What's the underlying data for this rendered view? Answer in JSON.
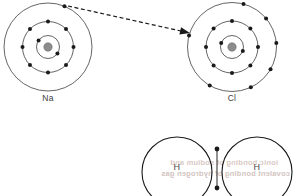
{
  "figure": {
    "width": 295,
    "height": 196,
    "background_color": "#ffffff"
  },
  "colors": {
    "shell_stroke": "#222222",
    "electron_fill": "#1a1a1a",
    "nucleus_fill": "#8c8c8c",
    "nucleus_stroke": "#5a5a5a",
    "arrow_stroke": "#1a1a1a",
    "label_text": "#3c3c3c",
    "h_lobe_stroke": "#1a1a1a",
    "bond_stroke": "#3a3a3a",
    "bleed_text": "#d9c9c4"
  },
  "ionic_bond": {
    "caption_sodium": "Na",
    "caption_chlorine": "Cl",
    "sodium": {
      "label": "Na",
      "label_x": 48,
      "label_y": 101,
      "center_x": 48,
      "center_y": 47,
      "nucleus_radius": 4.2,
      "shells": [
        {
          "name": "inner-shell",
          "radius": 11.5,
          "electron_count": 2,
          "electron_angles": [
            215,
            35
          ]
        },
        {
          "name": "middle-shell",
          "radius": 25.5,
          "electron_count": 8,
          "electron_angles": [
            270,
            315,
            0,
            45,
            90,
            135,
            180,
            225
          ]
        },
        {
          "name": "outer-shell",
          "radius": 44.0,
          "electron_count": 1,
          "electron_angles": [
            292
          ]
        }
      ]
    },
    "chlorine": {
      "label": "Cl",
      "label_x": 232,
      "label_y": 101,
      "center_x": 232,
      "center_y": 47,
      "nucleus_radius": 4.2,
      "shells": [
        {
          "name": "inner-shell",
          "radius": 11.5,
          "electron_count": 2,
          "electron_angles": [
            200,
            20
          ]
        },
        {
          "name": "middle-shell",
          "radius": 26.0,
          "electron_count": 8,
          "electron_angles": [
            270,
            315,
            0,
            45,
            90,
            135,
            180,
            225
          ]
        },
        {
          "name": "outer-shell",
          "radius": 44.5,
          "electron_count": 7,
          "electron_angles": [
            285,
            320,
            355,
            30,
            65,
            120,
            195
          ]
        }
      ]
    },
    "electron_radius": 2.0,
    "transfer_arrow": {
      "name": "electron-transfer-arrow",
      "style": "dashed",
      "from_x": 68,
      "from_y": 6,
      "to_x": 190,
      "to_y": 33
    }
  },
  "covalent_bond": {
    "left_atom_label": "H",
    "right_atom_label": "H",
    "left_label_x": 177,
    "left_label_y": 170,
    "right_label_x": 257,
    "right_label_y": 170,
    "left_center_x": 177,
    "left_center_y": 172,
    "right_center_x": 257,
    "right_center_y": 172,
    "lobe_radius": 35,
    "shared_electrons": [
      {
        "name": "shared-electron-top",
        "x": 217,
        "y": 149
      },
      {
        "name": "shared-electron-bottom",
        "x": 217,
        "y": 188
      }
    ],
    "shared_electron_radius": 2.4
  },
  "background_bleed": {
    "line1": "ionic bonding of sodium and",
    "line1_x": 150,
    "line1_y": 165,
    "line2": "covalent bonding of hydrogen gas",
    "line2_x": 150,
    "line2_y": 176
  }
}
